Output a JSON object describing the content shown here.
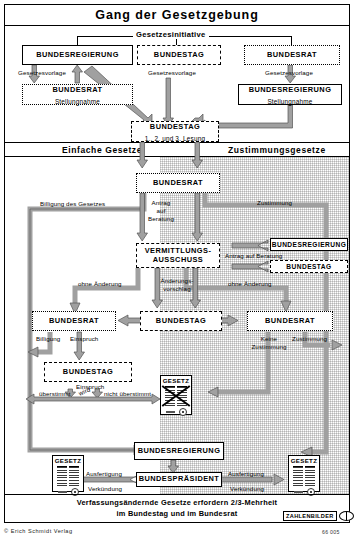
{
  "title": "Gang der Gesetzgebung",
  "initiative": {
    "label": "Gesetzesinitiative"
  },
  "bands": {
    "left": "Einfache Gesetze",
    "right": "Zustimmungsgesetze"
  },
  "boxes": {
    "bundesregierung_top": "BUNDESREGIERUNG",
    "bundestag_top": "BUNDESTAG",
    "bundesrat_top": "BUNDESRAT",
    "bundesrat_stellungnahme_name": "BUNDESRAT",
    "bundesrat_stellungnahme_sub": "Stellungnahme",
    "bundesregierung_stellungnahme_name": "BUNDESREGIERUNG",
    "bundesregierung_stellungnahme_sub": "Stellungnahme",
    "bundestag_lesung_name": "BUNDESTAG",
    "bundestag_lesung_sub": "1., 2. und 3. Lesung",
    "bundesrat_main": "BUNDESRAT",
    "vermittlungsausschuss_line1": "VERMITTLUNGS-",
    "vermittlungsausschuss_line2": "AUSSCHUSS",
    "bundesregierung_antrag": "BUNDESREGIERUNG",
    "bundestag_antrag": "BUNDESTAG",
    "bundesrat_left": "BUNDESRAT",
    "bundestag_mid": "BUNDESTAG",
    "bundesrat_right": "BUNDESRAT",
    "bundestag_einspruch": "BUNDESTAG",
    "bundesregierung_bottom": "BUNDESREGIERUNG",
    "bundespraesident": "BUNDESPRÄSIDENT"
  },
  "arrow_labels": {
    "gesetzesvorlage_left": "Gesetzesvorlage",
    "gesetzesvorlage_mid": "Gesetzesvorlage",
    "gesetzesvorlage_right": "Gesetzesvorlage",
    "billigung_des_gesetzes": "Billigung des Gesetzes",
    "antrag_auf_beratung_1": "Antrag",
    "antrag_auf_beratung_2": "auf",
    "antrag_auf_beratung_3": "Beratung",
    "zustimmung_top": "Zustimmung",
    "antrag_auf_beratung_right": "Antrag auf Beratung",
    "ohne_aenderung_left": "ohne Änderung",
    "ohne_aenderung_right": "ohne Änderung",
    "aenderungsvorschlag_1": "Änderungs-",
    "aenderungsvorschlag_2": "vorschlag",
    "billigung": "Billigung",
    "einspruch": "Einspruch",
    "keine_zustimmung_1": "Keine",
    "keine_zustimmung_2": "Zustimmung",
    "zustimmung_bottom": "Zustimmung",
    "einspruch_wird_1": "Einspruch",
    "einspruch_wird_2": "wird",
    "ueberstimmt": "überstimmt",
    "nicht_ueberstimmt": "nicht überstimmt",
    "ausfertigung_left": "Ausfertigung",
    "verkuendung_left": "Verkündung",
    "ausfertigung_right": "Ausfertigung",
    "verkuendung_right": "Verkündung"
  },
  "documents": {
    "gesetz_left": "GESETZ",
    "gesetz_crossed": "GESETZ",
    "gesetz_right": "GESETZ"
  },
  "footer": {
    "line1": "Verfassungsändernde Gesetze erfordern 2/3-Mehrheit",
    "line2": "im Bundestag und im Bundesrat",
    "logo": "ZAHLENBILDER",
    "copyright": "© Erich Schmidt Verlag",
    "refnum": "66 005"
  },
  "colors": {
    "ink": "#000000",
    "arrow_fill": "#9a9a9a",
    "arrow_stroke": "#4a4a4a",
    "shade": "#e2e2e2"
  }
}
